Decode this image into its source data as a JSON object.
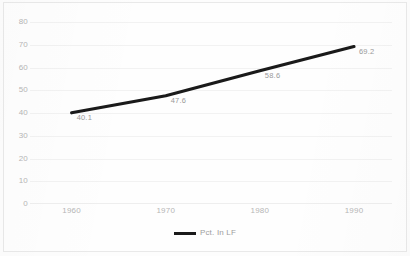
{
  "chart_data": {
    "type": "line",
    "title": "",
    "xlabel": "",
    "ylabel": "",
    "x": [
      1960,
      1970,
      1980,
      1990
    ],
    "categories": [
      "1960",
      "1970",
      "1980",
      "1990"
    ],
    "values": [
      40.1,
      47.6,
      58.6,
      69.2
    ],
    "point_labels": [
      "40.1",
      "47.6",
      "58.6",
      "69.2"
    ],
    "series": [
      {
        "name": "Pct. In LF",
        "values": [
          40.1,
          47.6,
          58.6,
          69.2
        ],
        "color": "#1a1a1a"
      }
    ],
    "ylim": [
      0,
      80
    ],
    "ytick_labels": [
      "80",
      "70",
      "60",
      "50",
      "40",
      "30",
      "20",
      "10",
      "0"
    ],
    "ytick_values": [
      80,
      70,
      60,
      50,
      40,
      30,
      20,
      10,
      0
    ],
    "xtick_labels": [
      "1960",
      "1970",
      "1980",
      "1990"
    ],
    "grid": true,
    "legend_position": "bottom",
    "legend": [
      "Pct. In LF"
    ]
  },
  "legend": {
    "series_label": "Pct. In LF"
  },
  "colors": {
    "line": "#1a1a1a",
    "tick_text": "#b6b6b6",
    "label_text": "#9a9a9a",
    "gridline": "#f2f2f2",
    "frame": "#e9e9e9",
    "background": "#fefefe"
  }
}
